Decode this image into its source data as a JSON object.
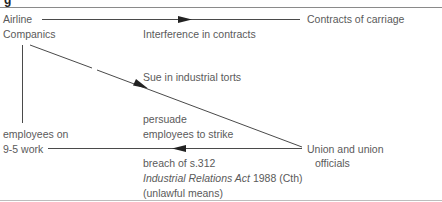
{
  "figure": {
    "caption_fragment": "g",
    "nodes": {
      "airline": [
        "Airline",
        "Companics"
      ],
      "contracts": "Contracts of carriage",
      "employees": [
        "employees on",
        "9-5 work"
      ],
      "union": [
        "Union and union",
        "officials"
      ]
    },
    "edge_labels": {
      "interference": "Interference in contracts",
      "sue": "Sue in industrial torts",
      "persuade": [
        "persuade",
        "employees to strike"
      ],
      "breach_line1": "breach of s.312",
      "breach_act_italic": "Industrial Relations Act",
      "breach_act_rest": " 1988 (Cth)",
      "breach_line3": "(unlawful means)"
    },
    "colors": {
      "line": "#4a4a4a",
      "text": "#5a5a5a",
      "rule": "#8a8a8a"
    }
  }
}
